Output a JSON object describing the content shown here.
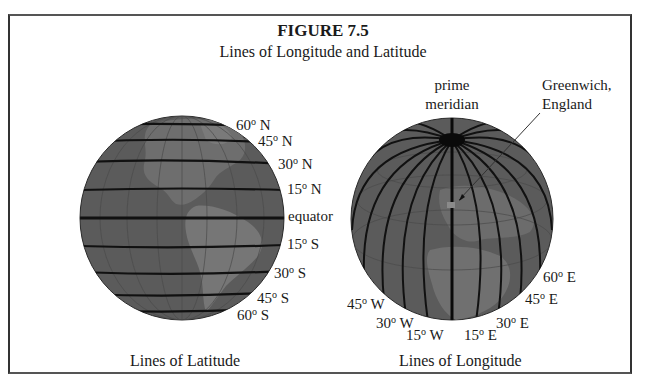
{
  "figure": {
    "title": "FIGURE 7.5",
    "subtitle": "Lines of Longitude and Latitude"
  },
  "latitude_globe": {
    "caption": "Lines of Latitude",
    "labels": [
      {
        "value": "60",
        "dir": "N"
      },
      {
        "value": "45",
        "dir": "N"
      },
      {
        "value": "30",
        "dir": "N"
      },
      {
        "value": "15",
        "dir": "N"
      },
      {
        "value": "equator",
        "dir": ""
      },
      {
        "value": "15",
        "dir": "S"
      },
      {
        "value": "30",
        "dir": "S"
      },
      {
        "value": "45",
        "dir": "S"
      },
      {
        "value": "60",
        "dir": "S"
      }
    ]
  },
  "longitude_globe": {
    "caption": "Lines of Longitude",
    "prime_meridian_label": [
      "prime",
      "meridian"
    ],
    "greenwich_label": [
      "Greenwich,",
      "England"
    ],
    "labels": [
      {
        "value": "45",
        "dir": "W"
      },
      {
        "value": "30",
        "dir": "W"
      },
      {
        "value": "15",
        "dir": "W"
      },
      {
        "value": "15",
        "dir": "E"
      },
      {
        "value": "30",
        "dir": "E"
      },
      {
        "value": "45",
        "dir": "E"
      },
      {
        "value": "60",
        "dir": "E"
      }
    ]
  },
  "colors": {
    "ocean": "#5b5b5b",
    "land": "#737373",
    "grid_line": "#111111",
    "frame": "#333333"
  },
  "degree_symbol": "o"
}
